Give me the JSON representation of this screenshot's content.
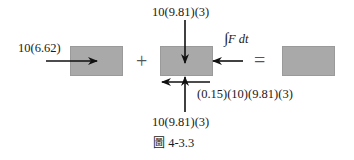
{
  "diagram": {
    "left_force_label": "10(6.62)",
    "top_force_label": "10(9.81)(3)",
    "impulse_label": "∫F dt",
    "friction_label": "(0.15)(10)(9.81)(3)",
    "bottom_force_label": "10(9.81)(3)",
    "plus_sign": "+",
    "equals_sign": "=",
    "box_color": "#a9a9a9"
  },
  "caption": {
    "prefix": "圖",
    "number": "4-3.3"
  }
}
